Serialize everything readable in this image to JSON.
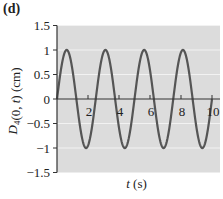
{
  "panel_label": "(d)",
  "chart_data": {
    "type": "line",
    "title": "",
    "panel": "(d)",
    "xlabel": "t (s)",
    "ylabel": "D4(0, t) (cm)",
    "xlim": [
      0,
      10.3
    ],
    "ylim": [
      -1.5,
      1.5
    ],
    "x_ticks": [
      2,
      4,
      6,
      8,
      10
    ],
    "x_tick_labels": [
      "2",
      "4",
      "6",
      "8",
      "10"
    ],
    "y_ticks": [
      1.5,
      1,
      0.5,
      0,
      -0.5,
      -1,
      -1.5
    ],
    "y_tick_labels": [
      "1.5",
      "1",
      "0.5",
      "0",
      "−0.5",
      "−1",
      "−1.5"
    ],
    "grid": true,
    "grid_axis": "y",
    "legend": null,
    "series": [
      {
        "name": "D4(0, t)",
        "function": "sin(2*pi*t/2.5)",
        "amplitude": 1,
        "period": 2.5,
        "x": [
          0,
          0.625,
          1.25,
          1.875,
          2.5,
          3.125,
          3.75,
          4.375,
          5,
          5.625,
          6.25,
          6.875,
          7.5,
          8.125,
          8.75,
          9.375,
          10
        ],
        "values": [
          0,
          1,
          0,
          -1,
          0,
          1,
          0,
          -1,
          0,
          1,
          0,
          -1,
          0,
          1,
          0,
          -1,
          0
        ]
      }
    ],
    "colors": {
      "plot_background": "#dcdcdc",
      "gridline": "#f2f2f2",
      "curve": "#555555",
      "axis": "#333333"
    }
  }
}
